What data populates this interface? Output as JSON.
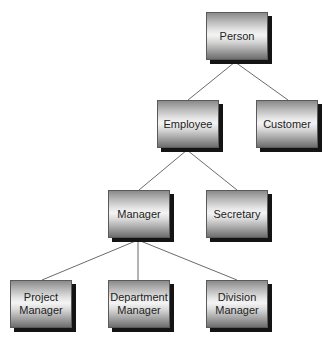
{
  "diagram": {
    "type": "class-hierarchy",
    "colors": {
      "background": "#ffffff",
      "connector": "#6b6b6b",
      "node_border": "#5a5a5a",
      "node_shadow": "#141414",
      "text": "#222222"
    },
    "nodes": {
      "person": {
        "label": "Person",
        "x": 206,
        "y": 12
      },
      "employee": {
        "label": "Employee",
        "x": 157,
        "y": 100
      },
      "customer": {
        "label": "Customer",
        "x": 256,
        "y": 100
      },
      "manager": {
        "label": "Manager",
        "x": 108,
        "y": 190
      },
      "secretary": {
        "label": "Secretary",
        "x": 206,
        "y": 190
      },
      "project_manager": {
        "label": "Project\nManager",
        "x": 10,
        "y": 280
      },
      "department_manager": {
        "label": "Department\nManager",
        "x": 108,
        "y": 280
      },
      "division_manager": {
        "label": "Division\nManager",
        "x": 206,
        "y": 280
      }
    },
    "edges": [
      {
        "from": "Person",
        "to": "Employee"
      },
      {
        "from": "Person",
        "to": "Customer"
      },
      {
        "from": "Employee",
        "to": "Manager"
      },
      {
        "from": "Employee",
        "to": "Secretary"
      },
      {
        "from": "Manager",
        "to": "Project Manager"
      },
      {
        "from": "Manager",
        "to": "Department Manager"
      },
      {
        "from": "Manager",
        "to": "Division Manager"
      }
    ]
  }
}
